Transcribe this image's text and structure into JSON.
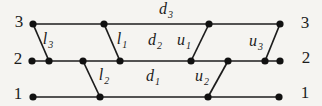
{
  "figure": {
    "kind": "three-level wire/transition diagram",
    "background_color": "#f5f4f1",
    "ink_color": "#1c1c1c"
  },
  "levels": {
    "left": [
      "3",
      "2",
      "1"
    ],
    "right": [
      "3",
      "2",
      "1"
    ]
  },
  "edge_labels": {
    "d3": {
      "base": "d",
      "sub": "3"
    },
    "d2": {
      "base": "d",
      "sub": "2"
    },
    "d1": {
      "base": "d",
      "sub": "1"
    },
    "l3": {
      "base": "l",
      "sub": "3"
    },
    "l1": {
      "base": "l",
      "sub": "1"
    },
    "l2": {
      "base": "l",
      "sub": "2"
    },
    "u1": {
      "base": "u",
      "sub": "1"
    },
    "u2": {
      "base": "u",
      "sub": "2"
    },
    "u3": {
      "base": "u",
      "sub": "3"
    }
  },
  "structure": {
    "horizontal_runs": [
      {
        "label": "d3",
        "level": 3
      },
      {
        "label": "d2",
        "level": 2
      },
      {
        "label": "d1",
        "level": 1
      }
    ],
    "down_edges": [
      {
        "label": "l3",
        "from_level": 3,
        "to_level": 2
      },
      {
        "label": "l1",
        "from_level": 3,
        "to_level": 2
      },
      {
        "label": "l2",
        "from_level": 2,
        "to_level": 1
      }
    ],
    "up_edges": [
      {
        "label": "u1",
        "from_level": 2,
        "to_level": 3
      },
      {
        "label": "u3",
        "from_level": 2,
        "to_level": 3
      },
      {
        "label": "u2",
        "from_level": 1,
        "to_level": 2
      }
    ]
  }
}
